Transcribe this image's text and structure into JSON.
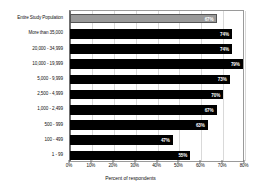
{
  "chart_data": {
    "type": "bar",
    "orientation": "horizontal",
    "title": "",
    "xlabel": "Percent of respondents",
    "ylabel": "",
    "xlim": [
      0,
      80
    ],
    "xticks": [
      "0%",
      "10%",
      "20%",
      "30%",
      "40%",
      "50%",
      "60%",
      "70%",
      "80%"
    ],
    "xtick_values": [
      0,
      10,
      20,
      30,
      40,
      50,
      60,
      70,
      80
    ],
    "grid": true,
    "legend": false,
    "categories": [
      "Entire Study Population",
      "More than 35,000",
      "20,000 - 34,999",
      "10,000 - 19,999",
      "5,000 - 9,999",
      "2,500 - 4,999",
      "1,000 - 2,499",
      "500 - 999",
      "100 - 499",
      "1 - 99"
    ],
    "values": [
      67,
      74,
      74,
      79,
      73,
      70,
      67,
      63,
      47,
      55
    ],
    "value_labels": [
      "67%",
      "74%",
      "74%",
      "79%",
      "73%",
      "70%",
      "67%",
      "63%",
      "47%",
      "55%"
    ],
    "bar_colors": [
      "#999999",
      "#000000",
      "#000000",
      "#000000",
      "#000000",
      "#000000",
      "#000000",
      "#000000",
      "#000000",
      "#000000"
    ],
    "highlight_index": 0,
    "colors": {
      "highlight": "#999999",
      "bar": "#000000",
      "grid": "#d9d9d9",
      "axis": "#6f6f6f",
      "background": "#ffffff",
      "value_text": "#ffffff"
    }
  }
}
